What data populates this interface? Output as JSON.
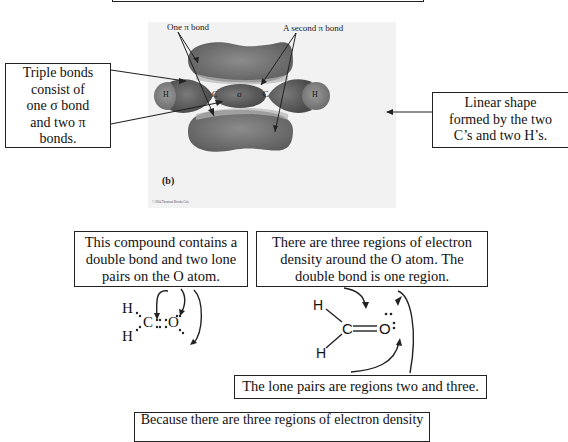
{
  "top_box": {
    "text": ""
  },
  "figure": {
    "label_one_pi": "One π bond",
    "label_second_pi": "A second π bond",
    "atom_h": "H",
    "atom_c": "C",
    "sigma": "σ",
    "panel_label": "(b)",
    "copyright": "© 2004 Thomson/Brooks Cole"
  },
  "callouts": {
    "triple_bonds": [
      "Triple bonds",
      "consist of",
      "one σ bond",
      "and two π",
      "bonds."
    ],
    "linear_shape": [
      "Linear shape",
      "formed by the two",
      "C’s and two H’s."
    ],
    "compound": [
      "This compound contains a",
      "double bond and two lone",
      "pairs on the O atom."
    ],
    "three_regions": [
      "There are three regions of electron",
      "density around the O atom.  The",
      "double bond is one region."
    ],
    "lone_pairs": "The lone pairs are regions two and three.",
    "because": "Because there are three regions of electron density"
  },
  "structures": {
    "lewis": {
      "h1": "H",
      "h2": "H",
      "c": "C",
      "o": "O"
    },
    "line": {
      "h1": "H",
      "h2": "H",
      "c": "C",
      "o": "O"
    }
  },
  "colors": {
    "orbital_dark": "#6e6e6e",
    "orbital_light": "#a9a9a9",
    "border": "#222222"
  }
}
